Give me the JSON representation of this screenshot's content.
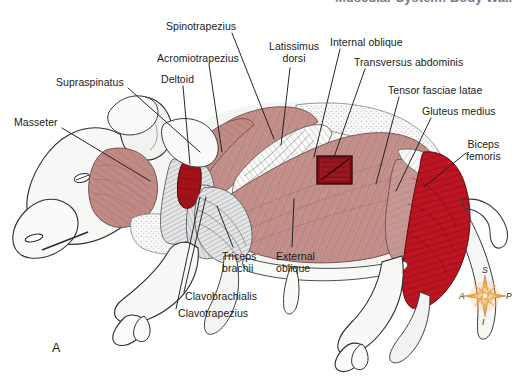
{
  "figure": {
    "title_cut_off": "Muscular System: Body Wall",
    "panel_letter": "A"
  },
  "labels": [
    {
      "id": "masseter",
      "text": "Masseter",
      "x": 14,
      "y": 116,
      "align": "left",
      "line": [
        [
          62,
          128
        ],
        [
          150,
          180
        ]
      ]
    },
    {
      "id": "supraspinatus",
      "text": "Supraspinatus",
      "x": 56,
      "y": 76,
      "align": "left",
      "line": [
        [
          128,
          88
        ],
        [
          198,
          152
        ]
      ]
    },
    {
      "id": "deltoid",
      "text": "Deltoid",
      "x": 161,
      "y": 73,
      "align": "left",
      "line": [
        [
          183,
          85
        ],
        [
          190,
          165
        ]
      ]
    },
    {
      "id": "acromiotrapezius",
      "text": "Acromiotrapezius",
      "x": 157,
      "y": 52,
      "align": "left",
      "line": [
        [
          208,
          63
        ],
        [
          221,
          153
        ]
      ]
    },
    {
      "id": "spinotrapezius",
      "text": "Spinotrapezius",
      "x": 166,
      "y": 20,
      "align": "left",
      "line": [
        [
          231,
          32
        ],
        [
          273,
          140
        ]
      ]
    },
    {
      "id": "latissimus-dorsi",
      "text": "Latissimus\ndorsi",
      "x": 272,
      "y": 40,
      "align": "left",
      "line": [
        [
          290,
          66
        ],
        [
          281,
          144
        ]
      ]
    },
    {
      "id": "internal-oblique",
      "text": "Internal oblique",
      "x": 330,
      "y": 36,
      "align": "left",
      "line": [
        [
          339,
          48
        ],
        [
          313,
          158
        ]
      ]
    },
    {
      "id": "transversus-abdominis",
      "text": "Transversus abdominis",
      "x": 354,
      "y": 56,
      "align": "left",
      "line": [
        [
          364,
          68
        ],
        [
          333,
          158
        ]
      ]
    },
    {
      "id": "tensor-fasciae-latae",
      "text": "Tensor fasciae latae",
      "x": 388,
      "y": 84,
      "align": "left",
      "line": [
        [
          398,
          96
        ],
        [
          375,
          185
        ]
      ]
    },
    {
      "id": "gluteus-medius",
      "text": "Gluteus medius",
      "x": 422,
      "y": 105,
      "align": "left",
      "line": [
        [
          430,
          117
        ],
        [
          395,
          192
        ]
      ]
    },
    {
      "id": "biceps-femoris",
      "text": "Biceps\nfemoris",
      "x": 469,
      "y": 138,
      "align": "left",
      "line": [
        [
          468,
          152
        ],
        [
          422,
          188
        ]
      ]
    },
    {
      "id": "triceps-brachii",
      "text": "Triceps\nbrachii",
      "x": 222,
      "y": 250,
      "align": "left",
      "line": [
        [
          232,
          248
        ],
        [
          216,
          205
        ]
      ]
    },
    {
      "id": "external-oblique",
      "text": "External\noblique",
      "x": 276,
      "y": 250,
      "align": "left",
      "line": [
        [
          292,
          248
        ],
        [
          294,
          198
        ]
      ]
    },
    {
      "id": "clavobrachialis",
      "text": "Clavobrachialis",
      "x": 185,
      "y": 290,
      "align": "left",
      "line": [
        [
          183,
          294
        ],
        [
          205,
          196
        ]
      ]
    },
    {
      "id": "clavotrapezius",
      "text": "Clavotrapezius",
      "x": 178,
      "y": 307,
      "align": "left",
      "line": [
        [
          176,
          310
        ],
        [
          199,
          196
        ]
      ]
    }
  ],
  "compass": {
    "name": "orientation-compass-rose",
    "superior": "S",
    "inferior": "I",
    "anterior": "A",
    "posterior": "P",
    "color": "#e8962f"
  },
  "colors": {
    "muscle_rose": "#c4908b",
    "muscle_rose_dark": "#a97772",
    "muscle_crimson": "#bc1420",
    "muscle_crimson_dark": "#8d0f19",
    "window_red": "#7e1018",
    "tendon_gray": "#b9bcbe",
    "skin_white": "#f4f4f2",
    "outline": "#2a2a2a",
    "label_text": "#1b1b1b"
  }
}
